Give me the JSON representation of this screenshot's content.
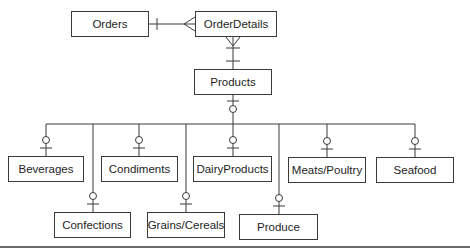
{
  "diagram": {
    "type": "entity-relationship",
    "line_color": "#3a3a3a",
    "entities": [
      {
        "id": "orders",
        "label": "Orders",
        "x": 71,
        "y": 11,
        "w": 78,
        "h": 26
      },
      {
        "id": "orderdetails",
        "label": "OrderDetails",
        "x": 195,
        "y": 11,
        "w": 82,
        "h": 26
      },
      {
        "id": "products",
        "label": "Products",
        "x": 194,
        "y": 69,
        "w": 78,
        "h": 26
      },
      {
        "id": "beverages",
        "label": "Beverages",
        "x": 8,
        "y": 156,
        "w": 76,
        "h": 26
      },
      {
        "id": "condiments",
        "label": "Condiments",
        "x": 101,
        "y": 156,
        "w": 77,
        "h": 26
      },
      {
        "id": "dairyproducts",
        "label": "DairyProducts",
        "x": 193,
        "y": 156,
        "w": 79,
        "h": 26
      },
      {
        "id": "meatspoultry",
        "label": "Meats/Poultry",
        "x": 288,
        "y": 157,
        "w": 78,
        "h": 26
      },
      {
        "id": "seafood",
        "label": "Seafood",
        "x": 376,
        "y": 157,
        "w": 78,
        "h": 26
      },
      {
        "id": "confections",
        "label": "Confections",
        "x": 54,
        "y": 212,
        "w": 77,
        "h": 26
      },
      {
        "id": "grainscereals",
        "label": "Grains/Cereals",
        "x": 147,
        "y": 212,
        "w": 78,
        "h": 26
      },
      {
        "id": "produce",
        "label": "Produce",
        "x": 239,
        "y": 214,
        "w": 79,
        "h": 26
      }
    ],
    "relationships": [
      {
        "from": "orders",
        "to": "orderdetails",
        "from_end": "one",
        "to_end": "many"
      },
      {
        "from": "products",
        "to": "orderdetails",
        "from_end": "one-and-only-one",
        "to_end": "many"
      },
      {
        "from": "products",
        "to": [
          "beverages",
          "condiments",
          "dairyproducts",
          "meatspoultry",
          "seafood",
          "confections",
          "grainscereals",
          "produce"
        ],
        "kind": "subtype",
        "parent_end": "zero-or-one",
        "child_end": "zero-or-one"
      }
    ]
  }
}
